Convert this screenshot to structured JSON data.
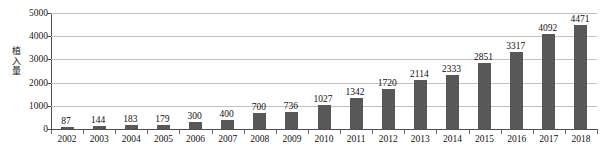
{
  "chart": {
    "y_axis_title": "植入量",
    "y_axis_title_chars": [
      "植",
      "入",
      "量"
    ]
  },
  "chart_data": {
    "type": "bar",
    "title": "",
    "subtitle": "",
    "xlabel": "",
    "ylabel": "植入量",
    "ylim": [
      0,
      5000
    ],
    "yticks": [
      0,
      1000,
      2000,
      3000,
      4000,
      5000
    ],
    "ytick_labels": [
      "0",
      "1000",
      "2000",
      "3000",
      "4000",
      "5000"
    ],
    "grid": true,
    "legend": false,
    "bar_color": "#585858",
    "show_data_labels": true,
    "categories": [
      "2002",
      "2003",
      "2004",
      "2005",
      "2006",
      "2007",
      "2008",
      "2009",
      "2010",
      "2011",
      "2012",
      "2013",
      "2014",
      "2015",
      "2016",
      "2017",
      "2018"
    ],
    "values": [
      87,
      144,
      183,
      179,
      300,
      400,
      700,
      736,
      1027,
      1342,
      1720,
      2114,
      2333,
      2851,
      3317,
      4092,
      4471
    ],
    "data_labels": [
      "87",
      "144",
      "183",
      "179",
      "300",
      "400",
      "700",
      "736",
      "1027",
      "1342",
      "1720",
      "2114",
      "2333",
      "2851",
      "3317",
      "4092",
      "4471"
    ]
  }
}
